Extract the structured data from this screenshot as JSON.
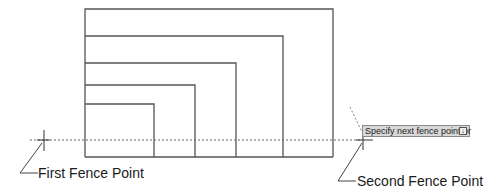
{
  "labels": {
    "first_point": "First Fence Point",
    "second_point": "Second Fence Point"
  },
  "tooltip": {
    "prompt": "Specify next fence point or",
    "options_icon": "down-arrow-icon",
    "options_glyph": "↓"
  },
  "drawing": {
    "stroke_color": "#555555",
    "fence_color": "#666666",
    "baseline_y": 157,
    "left_x": 85,
    "rectangles": [
      {
        "top": 9,
        "right": 333
      },
      {
        "top": 36,
        "right": 283
      },
      {
        "top": 63,
        "right": 236
      },
      {
        "top": 85,
        "right": 195
      },
      {
        "top": 104,
        "right": 154
      }
    ],
    "fence_line": {
      "x1": 30,
      "x2": 362,
      "y": 140
    },
    "first_point": {
      "x": 44,
      "y": 140
    },
    "second_point": {
      "x": 363,
      "y": 140
    }
  }
}
